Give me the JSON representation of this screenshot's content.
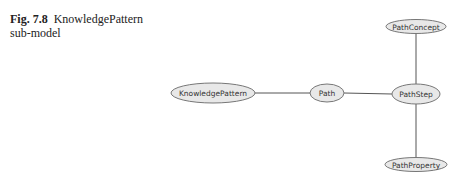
{
  "caption": {
    "number": "Fig. 7.8",
    "text": "KnowledgePattern sub-model"
  },
  "diagram": {
    "nodes": [
      {
        "id": "KnowledgePattern",
        "label": "KnowledgePattern"
      },
      {
        "id": "Path",
        "label": "Path"
      },
      {
        "id": "PathStep",
        "label": "PathStep"
      },
      {
        "id": "PathConcept",
        "label": "PathConcept"
      },
      {
        "id": "PathProperty",
        "label": "PathProperty"
      }
    ],
    "edges": [
      {
        "from": "KnowledgePattern",
        "to": "Path"
      },
      {
        "from": "Path",
        "to": "PathStep"
      },
      {
        "from": "PathStep",
        "to": "PathConcept"
      },
      {
        "from": "PathStep",
        "to": "PathProperty"
      }
    ],
    "colors": {
      "node_fill": "#e8e8e8",
      "node_stroke": "#777777",
      "edge": "#555555"
    }
  }
}
